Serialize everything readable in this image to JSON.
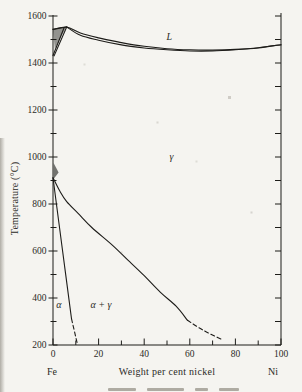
{
  "figure": {
    "background": "#f5f4f0",
    "ink": "#1d1c19",
    "text_color": "#2b2a26"
  },
  "chart_data": {
    "type": "line",
    "title": "",
    "xlabel": "Weight per cent nickel",
    "ylabel": "Temperature (°C)",
    "x_axis_end_labels": {
      "left": "Fe",
      "right": "Ni"
    },
    "xlim": [
      0,
      100
    ],
    "ylim": [
      200,
      1600
    ],
    "grid": false,
    "x_ticks": {
      "labeled": [
        0,
        20,
        40,
        60,
        80,
        100
      ],
      "minor": [
        10,
        30,
        50,
        70,
        90
      ]
    },
    "y_ticks": {
      "labeled": [
        1600,
        1400,
        1200,
        1000,
        800,
        600,
        400,
        200
      ],
      "minor": [
        1500,
        1300,
        1100,
        900,
        700,
        500,
        300
      ]
    },
    "region_labels": [
      {
        "text": "L",
        "x": 51,
        "y": 1512
      },
      {
        "text": "γ",
        "x": 52,
        "y": 1000
      },
      {
        "text": "α",
        "x": 2.6,
        "y": 370
      },
      {
        "text": "α + γ",
        "x": 21,
        "y": 370
      }
    ],
    "series": [
      {
        "name": "liquidus",
        "style": "solid",
        "points": [
          [
            0,
            1543
          ],
          [
            6,
            1553
          ],
          [
            12,
            1528
          ],
          [
            20,
            1507
          ],
          [
            30,
            1487
          ],
          [
            40,
            1471
          ],
          [
            50,
            1461
          ],
          [
            60,
            1456
          ],
          [
            70,
            1455
          ],
          [
            80,
            1458
          ],
          [
            90,
            1465
          ],
          [
            100,
            1478
          ]
        ]
      },
      {
        "name": "solidus",
        "style": "solid",
        "points": [
          [
            6,
            1553
          ],
          [
            12,
            1518
          ],
          [
            20,
            1497
          ],
          [
            30,
            1477
          ],
          [
            40,
            1464
          ],
          [
            50,
            1456
          ],
          [
            60,
            1451
          ],
          [
            70,
            1451
          ],
          [
            80,
            1456
          ],
          [
            90,
            1464
          ],
          [
            100,
            1478
          ]
        ]
      },
      {
        "name": "delta-solidus-sliver",
        "style": "solid",
        "points": [
          [
            0,
            1543
          ],
          [
            6,
            1553
          ]
        ]
      },
      {
        "name": "delta-gamma-boundary",
        "style": "solid",
        "points": [
          [
            6,
            1553
          ],
          [
            0.5,
            1430
          ]
        ]
      },
      {
        "name": "delta-gamma-boundary-inner",
        "style": "solid",
        "points": [
          [
            4.8,
            1548
          ],
          [
            0,
            1432
          ]
        ]
      },
      {
        "name": "gamma-alphagamma-boundary",
        "style": "solid",
        "points": [
          [
            0,
            912
          ],
          [
            3,
            855
          ],
          [
            6,
            810
          ],
          [
            11,
            760
          ],
          [
            17,
            700
          ],
          [
            26,
            625
          ],
          [
            33,
            560
          ],
          [
            40,
            495
          ],
          [
            47,
            425
          ],
          [
            54,
            365
          ],
          [
            59,
            305
          ]
        ]
      },
      {
        "name": "gamma-alphagamma-extrapolated",
        "style": "dashed",
        "points": [
          [
            59,
            305
          ],
          [
            66,
            262
          ],
          [
            74,
            224
          ]
        ]
      },
      {
        "name": "alpha-alphagamma-boundary",
        "style": "solid",
        "points": [
          [
            0,
            912
          ],
          [
            4.2,
            600
          ],
          [
            8.1,
            312
          ]
        ]
      },
      {
        "name": "alpha-alphagamma-extrapolated",
        "style": "dashed",
        "points": [
          [
            8.1,
            312
          ],
          [
            10.8,
            200
          ]
        ]
      }
    ]
  }
}
